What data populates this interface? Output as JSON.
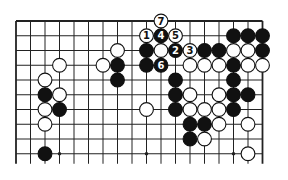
{
  "diagram": {
    "type": "go-board-partial",
    "grid": {
      "cols": 18,
      "rows": 10,
      "origin_x": 16,
      "origin_y": 21,
      "spacing_x": 14.5,
      "spacing_y": 14.75,
      "edges": {
        "top": true,
        "left": true,
        "right": true,
        "bottom": false
      },
      "line_color": "#222222",
      "board_color": "#ffffff"
    },
    "colors": {
      "black": "#111111",
      "white": "#ffffff",
      "outline": "#111111"
    },
    "star_points": [
      {
        "col": 3,
        "row": 9
      },
      {
        "col": 9,
        "row": 9
      },
      {
        "col": 15,
        "row": 9
      }
    ],
    "stones": [
      {
        "col": 10,
        "row": 0,
        "color": "white",
        "label": "7"
      },
      {
        "col": 9,
        "row": 1,
        "color": "white",
        "label": "1"
      },
      {
        "col": 10,
        "row": 1,
        "color": "black",
        "label": "4"
      },
      {
        "col": 11,
        "row": 1,
        "color": "white",
        "label": "5"
      },
      {
        "col": 15,
        "row": 1,
        "color": "black"
      },
      {
        "col": 16,
        "row": 1,
        "color": "black"
      },
      {
        "col": 17,
        "row": 1,
        "color": "black"
      },
      {
        "col": 7,
        "row": 2,
        "color": "white"
      },
      {
        "col": 9,
        "row": 2,
        "color": "black"
      },
      {
        "col": 10,
        "row": 2,
        "color": "white"
      },
      {
        "col": 11,
        "row": 2,
        "color": "black",
        "label": "2"
      },
      {
        "col": 12,
        "row": 2,
        "color": "white",
        "label": "3"
      },
      {
        "col": 13,
        "row": 2,
        "color": "black"
      },
      {
        "col": 14,
        "row": 2,
        "color": "black"
      },
      {
        "col": 15,
        "row": 2,
        "color": "white"
      },
      {
        "col": 16,
        "row": 2,
        "color": "white"
      },
      {
        "col": 17,
        "row": 2,
        "color": "black"
      },
      {
        "col": 3,
        "row": 3,
        "color": "white"
      },
      {
        "col": 6,
        "row": 3,
        "color": "white"
      },
      {
        "col": 7,
        "row": 3,
        "color": "black"
      },
      {
        "col": 9,
        "row": 3,
        "color": "black"
      },
      {
        "col": 10,
        "row": 3,
        "color": "black",
        "label": "6"
      },
      {
        "col": 12,
        "row": 3,
        "color": "white"
      },
      {
        "col": 13,
        "row": 3,
        "color": "white"
      },
      {
        "col": 14,
        "row": 3,
        "color": "white"
      },
      {
        "col": 15,
        "row": 3,
        "color": "black"
      },
      {
        "col": 16,
        "row": 3,
        "color": "white"
      },
      {
        "col": 17,
        "row": 3,
        "color": "white"
      },
      {
        "col": 2,
        "row": 4,
        "color": "white"
      },
      {
        "col": 7,
        "row": 4,
        "color": "black"
      },
      {
        "col": 11,
        "row": 4,
        "color": "black"
      },
      {
        "col": 15,
        "row": 4,
        "color": "black"
      },
      {
        "col": 2,
        "row": 5,
        "color": "black"
      },
      {
        "col": 3,
        "row": 5,
        "color": "white"
      },
      {
        "col": 11,
        "row": 5,
        "color": "black"
      },
      {
        "col": 12,
        "row": 5,
        "color": "white"
      },
      {
        "col": 14,
        "row": 5,
        "color": "white"
      },
      {
        "col": 15,
        "row": 5,
        "color": "black"
      },
      {
        "col": 16,
        "row": 5,
        "color": "black"
      },
      {
        "col": 2,
        "row": 6,
        "color": "white"
      },
      {
        "col": 3,
        "row": 6,
        "color": "black"
      },
      {
        "col": 9,
        "row": 6,
        "color": "white"
      },
      {
        "col": 11,
        "row": 6,
        "color": "black"
      },
      {
        "col": 12,
        "row": 6,
        "color": "white"
      },
      {
        "col": 13,
        "row": 6,
        "color": "white"
      },
      {
        "col": 14,
        "row": 6,
        "color": "white"
      },
      {
        "col": 15,
        "row": 6,
        "color": "black"
      },
      {
        "col": 2,
        "row": 7,
        "color": "white"
      },
      {
        "col": 12,
        "row": 7,
        "color": "black"
      },
      {
        "col": 13,
        "row": 7,
        "color": "black"
      },
      {
        "col": 14,
        "row": 7,
        "color": "white"
      },
      {
        "col": 16,
        "row": 7,
        "color": "white"
      },
      {
        "col": 12,
        "row": 8,
        "color": "black"
      },
      {
        "col": 13,
        "row": 8,
        "color": "white"
      },
      {
        "col": 2,
        "row": 9,
        "color": "black"
      },
      {
        "col": 16,
        "row": 9,
        "color": "white"
      }
    ]
  }
}
